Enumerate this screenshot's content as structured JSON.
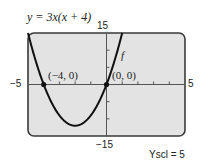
{
  "title": "y = 3x(x + 4)",
  "labels": {
    "ymax": "15",
    "ymin": "−15",
    "xmin": "−5",
    "xmax": "5",
    "curve_name": "f",
    "point1": "(−4, 0)",
    "point2": "(0, 0)",
    "yscl": "Yscl = 5"
  },
  "chart_data": {
    "type": "line",
    "title": "y = 3x(x + 4)",
    "function": "3x(x+4)",
    "xlim": [
      -5,
      5
    ],
    "ylim": [
      -15,
      15
    ],
    "xscl": 1,
    "yscl": 5,
    "grid": false,
    "series": [
      {
        "name": "f",
        "x": [
          -5,
          -4.5,
          -4,
          -3.5,
          -3,
          -2.5,
          -2,
          -1.5,
          -1,
          -0.5,
          0,
          0.5,
          1
        ],
        "y": [
          15,
          6.75,
          0,
          -5.25,
          -9,
          -11.25,
          -12,
          -11.25,
          -9,
          -5.25,
          0,
          6.75,
          15
        ]
      }
    ],
    "annotations": [
      {
        "label": "(−4, 0)",
        "x": -4,
        "y": 0
      },
      {
        "label": "(0, 0)",
        "x": 0,
        "y": 0
      }
    ],
    "vertex": {
      "x": -2,
      "y": -12
    }
  },
  "colors": {
    "screen": "#e3e3e3",
    "frame": "#3a3a3a",
    "curve": "#111111"
  }
}
